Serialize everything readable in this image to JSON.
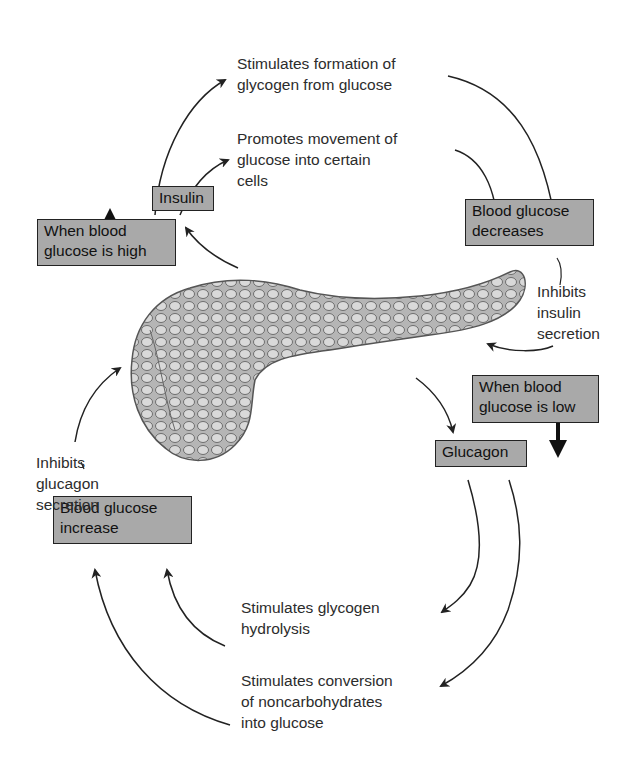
{
  "diagram": {
    "center_image": "pancreas-illustration",
    "boxes": {
      "when_high": "When blood\nglucose is high",
      "insulin": "Insulin",
      "decreases": "Blood glucose\ndecreases",
      "when_low": "When blood\nglucose is low",
      "glucagon": "Glucagon",
      "increase": "Blood glucose\nincrease"
    },
    "labels": {
      "glycogen_formation": "Stimulates formation of\nglycogen from glucose",
      "glucose_movement": "Promotes movement of\nglucose into certain\ncells",
      "inhibits_insulin": "Inhibits\ninsulin\nsecretion",
      "inhibits_glucagon": "Inhibits\nglucagon\nsecretion",
      "glycogen_hydrolysis": "Stimulates glycogen\nhydrolysis",
      "conversion": "Stimulates conversion\nof noncarbohydrates\ninto glucose"
    },
    "colors": {
      "box_fill": "#a9a9a9",
      "box_border": "#222222",
      "arrow": "#222222",
      "pancreas": "#8c8c8c"
    }
  }
}
